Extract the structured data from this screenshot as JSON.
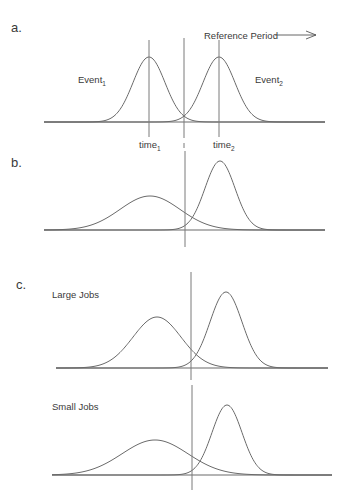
{
  "figure": {
    "panels": [
      {
        "id": "a",
        "letter": "a.",
        "letter_pos": [
          11,
          32
        ],
        "baseline": {
          "y": 122,
          "x1": 44,
          "x2": 325
        },
        "curves": [
          {
            "name": "Event1",
            "mu": 149,
            "sigma": 16,
            "peak_y": 57
          },
          {
            "name": "Event2",
            "mu": 219,
            "sigma": 16,
            "peak_y": 57
          }
        ],
        "vlines": [
          {
            "name": "time1-line",
            "x": 149,
            "y1": 40,
            "y2": 137
          },
          {
            "name": "time2-line",
            "x": 219,
            "y1": 40,
            "y2": 137
          }
        ],
        "labels": [
          {
            "name": "event1-label",
            "text": "Event",
            "sub": "1",
            "x": 78,
            "y": 83
          },
          {
            "name": "event2-label",
            "text": "Event",
            "sub": "2",
            "x": 255,
            "y": 83
          },
          {
            "name": "time1-label",
            "text": "time",
            "sub": "1",
            "x": 139,
            "y": 148
          },
          {
            "name": "time2-label",
            "text": "time",
            "sub": "2",
            "x": 213,
            "y": 148
          }
        ],
        "reference": {
          "text": "Reference Period",
          "x": 204,
          "y": 39,
          "arrow_x1": 275,
          "arrow_x2": 316,
          "arrow_y": 35
        }
      },
      {
        "id": "b",
        "letter": "b.",
        "letter_pos": [
          11,
          167
        ],
        "baseline": {
          "y": 230,
          "x1": 44,
          "x2": 325
        },
        "curves": [
          {
            "name": "wide-curve",
            "mu": 150,
            "sigma": 30,
            "peak_y": 196
          },
          {
            "name": "narrow-curve",
            "mu": 220,
            "sigma": 15,
            "peak_y": 161
          }
        ],
        "vlines": [],
        "labels": []
      },
      {
        "id": "c-large",
        "letter": "c.",
        "letter_pos": [
          16,
          289
        ],
        "subtitle": {
          "text": "Large Jobs",
          "x": 52,
          "y": 298
        },
        "baseline": {
          "y": 368,
          "x1": 56,
          "x2": 328
        },
        "curves": [
          {
            "name": "wide-curve",
            "mu": 157,
            "sigma": 24,
            "peak_y": 317
          },
          {
            "name": "narrow-curve",
            "mu": 226,
            "sigma": 16,
            "peak_y": 292
          }
        ],
        "vlines": [],
        "labels": []
      },
      {
        "id": "c-small",
        "letter": "",
        "subtitle": {
          "text": "Small Jobs",
          "x": 52,
          "y": 410
        },
        "baseline": {
          "y": 475,
          "x1": 52,
          "x2": 332
        },
        "curves": [
          {
            "name": "wide-curve",
            "mu": 155,
            "sigma": 33,
            "peak_y": 440
          },
          {
            "name": "narrow-curve",
            "mu": 227,
            "sigma": 15,
            "peak_y": 405
          }
        ],
        "vlines": [],
        "labels": []
      }
    ],
    "divider_segments": [
      {
        "x": 184,
        "y1": 38,
        "y2": 138
      },
      {
        "x": 184,
        "y1": 143,
        "y2": 148
      },
      {
        "x": 185,
        "y1": 151,
        "y2": 247
      },
      {
        "x": 191,
        "y1": 272,
        "y2": 380
      },
      {
        "x": 192,
        "y1": 385,
        "y2": 490
      }
    ],
    "text": {
      "panel_a_letter": "a.",
      "panel_b_letter": "b.",
      "panel_c_letter": "c.",
      "event1": "Event",
      "event1_sub": "1",
      "event2": "Event",
      "event2_sub": "2",
      "time1": "time",
      "time1_sub": "1",
      "time2": "time",
      "time2_sub": "2",
      "reference_period": "Reference Period",
      "large_jobs": "Large Jobs",
      "small_jobs": "Small Jobs"
    },
    "colors": {
      "stroke": "#6a6a6a",
      "text": "#3a3a3a",
      "background": "#ffffff"
    }
  }
}
